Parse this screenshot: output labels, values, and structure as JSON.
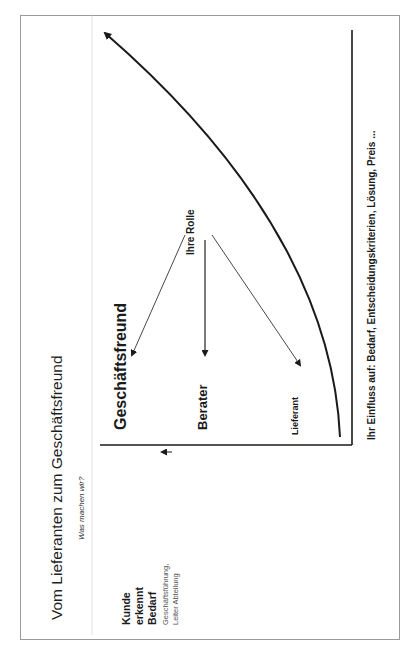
{
  "slide": {
    "title": "Vom Lieferanten zum Geschäftsfreund",
    "questions": {
      "what": "Was machen wir?",
      "how": "Wie machen wir es?",
      "who": "Mit wem machen wir es?"
    },
    "steps": [
      {
        "head": "Kunde erkennt Bedarf",
        "sub": "Geschäftsführung, Leiter Abteilung"
      },
      {
        "head": "Kunde bildet Projektteam",
        "sub": "Fachabteilung, Führung mittlere Ebene etc."
      },
      {
        "head": "Lösung wird ausgewählt",
        "sub": "Fachabteilung, ggf. Präsentation bei GF oder Leiter Abteilung"
      },
      {
        "head": "Kunde sucht Lieferanten für selbstentwickelte Lösung",
        "sub": "Einkauf, IT, Organisationsabteilung Personalabteilung etc."
      }
    ],
    "axis_label": "Möglicher Beschaffungsprozess beim Kunden",
    "roles": {
      "heading": "Ihre Rolle",
      "items": [
        "Geschäftsfreund",
        "Berater",
        "Lieferant"
      ]
    },
    "influence": "Ihr Einfluss auf: Bedarf, Entscheidungskriterien, Lösung, Preis ..."
  },
  "colors": {
    "ink": "#1a1a1a",
    "border": "#9a9a9a",
    "subtext": "#555555"
  }
}
